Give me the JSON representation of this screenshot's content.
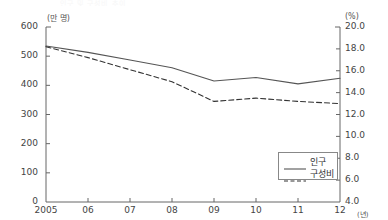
{
  "ghost_title": "인구 및 구성비 추이",
  "axis": {
    "left_unit": "(만 명)",
    "right_unit": "(%)",
    "x_unit": "(년)"
  },
  "legend": {
    "items": [
      {
        "label": "인구",
        "style": "solid",
        "color": "#555555"
      },
      {
        "label": "구성비",
        "style": "dashed",
        "color": "#333333"
      }
    ]
  },
  "chart_data": {
    "type": "line",
    "title": "인구 및 구성비 추이",
    "xlabel": "(년)",
    "ylabel": "(만 명)",
    "y2label": "(%)",
    "grid": false,
    "legend_position": "bottom-right",
    "categories": [
      "2005",
      "06",
      "07",
      "08",
      "09",
      "10",
      "11",
      "12"
    ],
    "x_tick_labels": [
      "2005",
      "06",
      "07",
      "08",
      "09",
      "10",
      "11",
      "12"
    ],
    "ylim": [
      0,
      600
    ],
    "y_ticks": [
      0,
      100,
      200,
      300,
      400,
      500,
      600
    ],
    "y_tick_labels": [
      "0",
      "100",
      "200",
      "300",
      "400",
      "500",
      "600"
    ],
    "y2lim": [
      4.0,
      20.0
    ],
    "y2_ticks": [
      4.0,
      6.0,
      8.0,
      10.0,
      12.0,
      14.0,
      16.0,
      18.0,
      20.0
    ],
    "y2_tick_labels": [
      "4.0",
      "6.0",
      "8.0",
      "10.0",
      "12.0",
      "14.0",
      "16.0",
      "18.0",
      "20.0"
    ],
    "series": [
      {
        "name": "인구",
        "axis": "left",
        "style": "solid",
        "color": "#555555",
        "values": [
          535,
          513,
          487,
          460,
          415,
          427,
          405,
          424
        ]
      },
      {
        "name": "구성비",
        "axis": "right",
        "style": "dashed",
        "color": "#333333",
        "values": [
          18.2,
          17.2,
          16.1,
          15.0,
          13.2,
          13.5,
          13.2,
          13.0
        ]
      }
    ]
  }
}
